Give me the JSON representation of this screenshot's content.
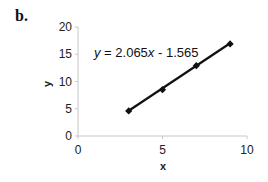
{
  "panel_label": "b.",
  "chart_data": {
    "type": "scatter",
    "title": "",
    "xlabel": "x",
    "ylabel": "y",
    "xlim": [
      0,
      10
    ],
    "ylim": [
      0,
      20
    ],
    "x_ticks": [
      "0",
      "5",
      "10"
    ],
    "y_ticks": [
      "0",
      "5",
      "10",
      "15",
      "20"
    ],
    "grid": false,
    "legend": "none",
    "series": [
      {
        "name": "data",
        "marker": "diamond",
        "line": "linear trendline",
        "x": [
          3,
          5,
          7,
          9
        ],
        "y": [
          4.6,
          8.5,
          12.9,
          16.9
        ]
      }
    ],
    "trendline": {
      "equation": "y = 2.065x - 1.565",
      "slope": 2.065,
      "intercept": -1.565
    },
    "annotations": [
      "y = 2.065x - 1.565"
    ],
    "colors": {
      "line": "#111111",
      "axis": "#c8c8c8",
      "text": "#222222"
    }
  }
}
